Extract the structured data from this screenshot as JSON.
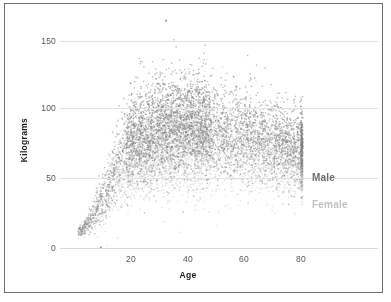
{
  "chart_data": {
    "type": "scatter",
    "title": "",
    "xlabel": "Age",
    "ylabel": "Kilograms",
    "xlim": [
      0,
      84
    ],
    "ylim": [
      0,
      168
    ],
    "xticks": [
      20,
      40,
      60,
      80
    ],
    "yticks": [
      0,
      50,
      100,
      150
    ],
    "xtick_labels": [
      "20",
      "40",
      "60",
      "80"
    ],
    "ytick_labels": [
      "0",
      "50",
      "100",
      "150"
    ],
    "grid": "horizontal",
    "legend_position": "right-inline",
    "series": [
      {
        "name": "Male",
        "color": "#808080",
        "point_count": 4200,
        "label_y_value": 50,
        "age_profile": [
          {
            "age": 1,
            "mean": 11,
            "sd": 2.5
          },
          {
            "age": 3,
            "mean": 15,
            "sd": 3
          },
          {
            "age": 5,
            "mean": 20,
            "sd": 4
          },
          {
            "age": 8,
            "mean": 30,
            "sd": 7
          },
          {
            "age": 11,
            "mean": 42,
            "sd": 11
          },
          {
            "age": 14,
            "mean": 56,
            "sd": 14
          },
          {
            "age": 17,
            "mean": 70,
            "sd": 15
          },
          {
            "age": 20,
            "mean": 78,
            "sd": 16
          },
          {
            "age": 25,
            "mean": 84,
            "sd": 17
          },
          {
            "age": 30,
            "mean": 88,
            "sd": 18
          },
          {
            "age": 35,
            "mean": 89,
            "sd": 18
          },
          {
            "age": 40,
            "mean": 88,
            "sd": 18
          },
          {
            "age": 45,
            "mean": 87,
            "sd": 17
          },
          {
            "age": 50,
            "mean": 86,
            "sd": 17
          },
          {
            "age": 55,
            "mean": 85,
            "sd": 17
          },
          {
            "age": 60,
            "mean": 83,
            "sd": 16
          },
          {
            "age": 65,
            "mean": 80,
            "sd": 15
          },
          {
            "age": 70,
            "mean": 77,
            "sd": 14
          },
          {
            "age": 75,
            "mean": 74,
            "sd": 13
          },
          {
            "age": 80,
            "mean": 72,
            "sd": 13
          }
        ]
      },
      {
        "name": "Female",
        "color": "#c8c8c8",
        "point_count": 4200,
        "label_y_value": 31,
        "age_profile": [
          {
            "age": 1,
            "mean": 10,
            "sd": 2.5
          },
          {
            "age": 3,
            "mean": 14,
            "sd": 3
          },
          {
            "age": 5,
            "mean": 19,
            "sd": 4
          },
          {
            "age": 8,
            "mean": 28,
            "sd": 7
          },
          {
            "age": 11,
            "mean": 40,
            "sd": 11
          },
          {
            "age": 14,
            "mean": 52,
            "sd": 13
          },
          {
            "age": 17,
            "mean": 60,
            "sd": 14
          },
          {
            "age": 20,
            "mean": 64,
            "sd": 15
          },
          {
            "age": 25,
            "mean": 68,
            "sd": 16
          },
          {
            "age": 30,
            "mean": 71,
            "sd": 17
          },
          {
            "age": 35,
            "mean": 73,
            "sd": 17
          },
          {
            "age": 40,
            "mean": 73,
            "sd": 17
          },
          {
            "age": 45,
            "mean": 73,
            "sd": 17
          },
          {
            "age": 50,
            "mean": 72,
            "sd": 16
          },
          {
            "age": 55,
            "mean": 71,
            "sd": 16
          },
          {
            "age": 60,
            "mean": 70,
            "sd": 15
          },
          {
            "age": 65,
            "mean": 68,
            "sd": 14
          },
          {
            "age": 70,
            "mean": 65,
            "sd": 13
          },
          {
            "age": 75,
            "mean": 62,
            "sd": 12
          },
          {
            "age": 80,
            "mean": 60,
            "sd": 12
          }
        ]
      }
    ],
    "annotations": [
      {
        "label": "high outlier",
        "age": 32,
        "value": 163
      },
      {
        "label": "low outlier",
        "age": 9,
        "value": 1
      },
      {
        "label": "top-coded age column",
        "age": 80,
        "note": "dense vertical band of points at age 80"
      }
    ]
  },
  "axes": {
    "y_title": "Kilograms",
    "x_title": "Age"
  },
  "legend": {
    "male_label": "Male",
    "female_label": "Female"
  },
  "colors": {
    "male": "#808080",
    "female": "#c8c8c8",
    "grid": "#e2e2e2",
    "frame": "#6f6f6f",
    "tick_text": "#58585a",
    "title_text": "#1a1a1a",
    "background": "#ffffff"
  }
}
